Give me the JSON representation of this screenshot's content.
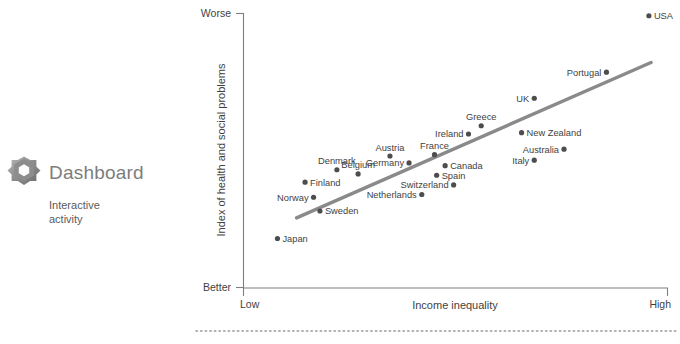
{
  "brand": {
    "title": "Dashboard",
    "subtitle": "Interactive activity",
    "logo_icon": "gear-hexagon-icon"
  },
  "colors": {
    "trend_line": "#8a8a8a",
    "dot": "#4d4d4d",
    "axis": "#7f7f7f",
    "brand_title": "#7d7d7d",
    "text": "#3f3f3f"
  },
  "chart_data": {
    "type": "scatter",
    "title": "",
    "xlabel": "Income inequality",
    "ylabel": "Index of health and social problems",
    "x_tick_labels": [
      "Low",
      "High"
    ],
    "y_tick_labels": [
      "Worse",
      "Better"
    ],
    "y_tick_order": "top-to-bottom",
    "grid": false,
    "legend": "none",
    "xlim": [
      0,
      100
    ],
    "ylim": [
      0,
      100
    ],
    "axis_note": "Qualitative axes; values estimated from pixel positions",
    "points": [
      {
        "name": "USA",
        "x": 95.5,
        "y": 99.0,
        "label_pos": "right"
      },
      {
        "name": "Portugal",
        "x": 85.5,
        "y": 78.5,
        "label_pos": "left"
      },
      {
        "name": "UK",
        "x": 68.5,
        "y": 69.0,
        "label_pos": "left"
      },
      {
        "name": "Greece",
        "x": 56.0,
        "y": 59.0,
        "label_pos": "above"
      },
      {
        "name": "Ireland",
        "x": 53.0,
        "y": 56.0,
        "label_pos": "left"
      },
      {
        "name": "New Zealand",
        "x": 65.5,
        "y": 56.5,
        "label_pos": "right"
      },
      {
        "name": "Australia",
        "x": 75.5,
        "y": 50.5,
        "label_pos": "left"
      },
      {
        "name": "Italy",
        "x": 68.5,
        "y": 46.5,
        "label_pos": "left"
      },
      {
        "name": "France",
        "x": 45.0,
        "y": 48.5,
        "label_pos": "above"
      },
      {
        "name": "Canada",
        "x": 47.5,
        "y": 44.5,
        "label_pos": "right"
      },
      {
        "name": "Austria",
        "x": 34.5,
        "y": 48.0,
        "label_pos": "above"
      },
      {
        "name": "Germany",
        "x": 39.0,
        "y": 45.5,
        "label_pos": "left"
      },
      {
        "name": "Denmark",
        "x": 22.0,
        "y": 43.0,
        "label_pos": "above"
      },
      {
        "name": "Belgium",
        "x": 27.0,
        "y": 41.5,
        "label_pos": "above"
      },
      {
        "name": "Spain",
        "x": 45.5,
        "y": 41.0,
        "label_pos": "right"
      },
      {
        "name": "Switzerland",
        "x": 49.5,
        "y": 37.5,
        "label_pos": "left"
      },
      {
        "name": "Netherlands",
        "x": 42.0,
        "y": 34.0,
        "label_pos": "left"
      },
      {
        "name": "Finland",
        "x": 14.5,
        "y": 38.5,
        "label_pos": "right"
      },
      {
        "name": "Norway",
        "x": 16.5,
        "y": 33.0,
        "label_pos": "left"
      },
      {
        "name": "Sweden",
        "x": 18.0,
        "y": 28.0,
        "label_pos": "right"
      },
      {
        "name": "Japan",
        "x": 8.0,
        "y": 18.0,
        "label_pos": "right"
      }
    ],
    "trend": {
      "label": "best-fit line",
      "x0": 12.5,
      "y0": 25.5,
      "x1": 96.0,
      "y1": 82.0
    }
  }
}
